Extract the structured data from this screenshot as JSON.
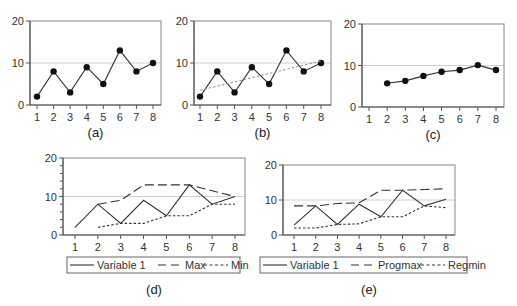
{
  "chart_data": [
    {
      "id": "a",
      "caption": "(a)",
      "type": "line",
      "x": [
        1,
        2,
        3,
        4,
        5,
        6,
        7,
        8
      ],
      "yticks": [
        0,
        10,
        20
      ],
      "ylim": [
        0,
        20
      ],
      "refline": 10,
      "series": [
        {
          "name": "Variable 1",
          "style": "solid",
          "markers": true,
          "x": [
            1,
            2,
            3,
            4,
            5,
            6,
            7,
            8
          ],
          "values": [
            2,
            8,
            3,
            9,
            5,
            13,
            8,
            10
          ]
        }
      ],
      "box": {
        "left": 30,
        "top": 21,
        "right": 161,
        "bottom": 105,
        "x1": 37,
        "x8": 153
      }
    },
    {
      "id": "b",
      "caption": "(b)",
      "type": "line",
      "x": [
        1,
        2,
        3,
        4,
        5,
        6,
        7,
        8
      ],
      "yticks": [
        0,
        10,
        20
      ],
      "ylim": [
        0,
        20
      ],
      "refline": 10,
      "series": [
        {
          "name": "Variable 1",
          "style": "solid",
          "markers": true,
          "x": [
            1,
            2,
            3,
            4,
            5,
            6,
            7,
            8
          ],
          "values": [
            2,
            8,
            3,
            9,
            5,
            13,
            8,
            10
          ]
        },
        {
          "name": "Trend",
          "style": "dotted",
          "markers": false,
          "x": [
            1,
            8
          ],
          "values": [
            3.5,
            10.5
          ]
        }
      ],
      "box": {
        "left": 194,
        "top": 21,
        "right": 331,
        "bottom": 105,
        "x1": 200,
        "x8": 321
      }
    },
    {
      "id": "c",
      "caption": "(c)",
      "type": "line",
      "x": [
        1,
        2,
        3,
        4,
        5,
        6,
        7,
        8
      ],
      "yticks": [
        0,
        10,
        20
      ],
      "ylim": [
        0,
        20
      ],
      "refline": 10,
      "series": [
        {
          "name": "Moving average",
          "style": "solid",
          "markers": true,
          "x": [
            2,
            3,
            4,
            5,
            6,
            7,
            8
          ],
          "values": [
            5.7,
            6.3,
            7.5,
            8.5,
            8.9,
            10.1,
            8.9
          ]
        }
      ],
      "box": {
        "left": 362,
        "top": 24,
        "right": 504,
        "bottom": 107,
        "x1": 369,
        "x8": 496
      }
    },
    {
      "id": "d",
      "caption": "(d)",
      "type": "line",
      "x": [
        1,
        2,
        3,
        4,
        5,
        6,
        7,
        8
      ],
      "yticks": [
        0,
        10,
        20
      ],
      "ylim": [
        0,
        20
      ],
      "minor_ticks": true,
      "refline": 10,
      "legend": [
        "Variable 1",
        "Max",
        "Min"
      ],
      "series": [
        {
          "name": "Variable 1",
          "style": "solid",
          "markers": false,
          "x": [
            1,
            2,
            3,
            4,
            5,
            6,
            7,
            8
          ],
          "values": [
            2,
            8,
            3,
            9,
            5,
            13,
            8,
            10
          ]
        },
        {
          "name": "Max",
          "style": "dashed",
          "markers": false,
          "x": [
            2,
            3,
            4,
            5,
            6,
            7,
            8
          ],
          "values": [
            8,
            9,
            13,
            13,
            13,
            11.5,
            10
          ]
        },
        {
          "name": "Min",
          "style": "dotted",
          "markers": false,
          "x": [
            2,
            3,
            4,
            5,
            6,
            7,
            8
          ],
          "values": [
            2,
            3,
            3,
            5,
            5,
            8,
            8
          ]
        }
      ],
      "box": {
        "left": 63,
        "top": 158,
        "right": 245,
        "bottom": 235,
        "x1": 75,
        "x8": 235
      },
      "legend_box": {
        "left": 67,
        "top": 257,
        "right": 240,
        "bottom": 273
      }
    },
    {
      "id": "e",
      "caption": "(e)",
      "type": "line",
      "x": [
        1,
        2,
        3,
        4,
        5,
        6,
        7,
        8
      ],
      "yticks": [
        0,
        10,
        20
      ],
      "ylim": [
        0,
        20
      ],
      "refline": 10,
      "legend": [
        "Variable 1",
        "Progmax",
        "Regmin"
      ],
      "series": [
        {
          "name": "Variable 1",
          "style": "solid",
          "markers": false,
          "x": [
            1,
            2,
            3,
            4,
            5,
            6,
            7,
            8
          ],
          "values": [
            2.8,
            8.3,
            3,
            8.8,
            5.2,
            12.8,
            8.3,
            10.2
          ]
        },
        {
          "name": "Progmax",
          "style": "dashed",
          "markers": false,
          "x": [
            1,
            2,
            3,
            4,
            5,
            6,
            7,
            8
          ],
          "values": [
            8.3,
            8.3,
            9,
            9.2,
            12.8,
            12.8,
            13,
            13.2
          ]
        },
        {
          "name": "Regmin",
          "style": "dotted",
          "markers": false,
          "x": [
            1,
            2,
            3,
            4,
            5,
            6,
            7,
            8
          ],
          "values": [
            2,
            2,
            3,
            3.2,
            5.2,
            5.2,
            8.3,
            7.8
          ]
        }
      ],
      "box": {
        "left": 283,
        "top": 165,
        "right": 455,
        "bottom": 235,
        "x1": 294,
        "x8": 446
      },
      "legend_box": {
        "left": 260,
        "top": 257,
        "right": 467,
        "bottom": 273
      }
    }
  ],
  "colors": {
    "line": "#333333",
    "axis": "#555555",
    "refline": "#d0d0d0",
    "marker": "#111111"
  }
}
